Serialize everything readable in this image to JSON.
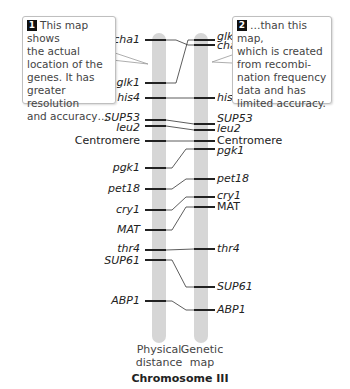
{
  "callouts": [
    {
      "number": "1",
      "text": "This map shows the actual location of the genes. It has greater resolution and accuracy…"
    },
    {
      "number": "2",
      "text": "…than this map, which is created from recombination frequency data and has limited accuracy."
    }
  ],
  "callout_lines": {
    "one": [
      "This map shows",
      "the actual",
      "location of the",
      "genes. It has",
      "greater resolution",
      "and accuracy…"
    ],
    "two": [
      "…than this map,",
      "which is created",
      "from recombi-",
      "nation frequency",
      "data and has",
      "limited accuracy."
    ]
  },
  "physical_map": {
    "label_line1": "Physical",
    "label_line2": "distance",
    "genes": [
      {
        "name": "cha1",
        "y": 40
      },
      {
        "name": "glk1",
        "y": 83
      },
      {
        "name": "his4",
        "y": 98
      },
      {
        "name": "SUP53",
        "y": 120
      },
      {
        "name": "leu2",
        "y": 126
      },
      {
        "name": "Centromere",
        "y": 141
      },
      {
        "name": "pgk1",
        "y": 168
      },
      {
        "name": "pet18",
        "y": 189
      },
      {
        "name": "cry1",
        "y": 210
      },
      {
        "name": "MAT",
        "y": 230
      },
      {
        "name": "thr4",
        "y": 250
      },
      {
        "name": "SUP61",
        "y": 260
      },
      {
        "name": "ABP1",
        "y": 301
      }
    ]
  },
  "genetic_map": {
    "label_line1": "Genetic",
    "label_line2": "map",
    "genes": [
      {
        "name": "glk1",
        "y": 40
      },
      {
        "name": "cha1",
        "y": 45
      },
      {
        "name": "his4",
        "y": 98
      },
      {
        "name": "SUP53",
        "y": 124
      },
      {
        "name": "leu2",
        "y": 130
      },
      {
        "name": "Centromere",
        "y": 141
      },
      {
        "name": "pgk1",
        "y": 149
      },
      {
        "name": "pet18",
        "y": 179
      },
      {
        "name": "cry1",
        "y": 197
      },
      {
        "name": "MAT",
        "y": 207
      },
      {
        "name": "thr4",
        "y": 249
      },
      {
        "name": "SUP61",
        "y": 287
      },
      {
        "name": "ABP1",
        "y": 310
      }
    ]
  },
  "title": "Chromosome III",
  "colors": {
    "bar": "#d6d6d6",
    "tick": "#222222",
    "callout_border": "#bfbfbf"
  }
}
